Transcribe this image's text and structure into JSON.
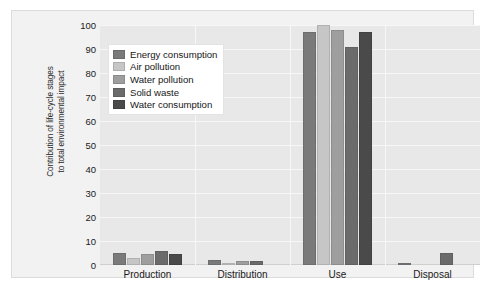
{
  "chart_data": {
    "type": "bar",
    "title": "",
    "xlabel": "",
    "ylabel": "Contribution of life-cycle stages to total environmental impact",
    "ylim": [
      0,
      100
    ],
    "yticks": [
      0,
      10,
      20,
      30,
      40,
      50,
      60,
      70,
      80,
      90,
      100
    ],
    "grid": true,
    "legend_position": "upper left",
    "categories": [
      "Production",
      "Distribution",
      "Use",
      "Disposal"
    ],
    "series": [
      {
        "name": "Energy consumption",
        "color": "#7a7a7a",
        "values": [
          5,
          2,
          97,
          1
        ]
      },
      {
        "name": "Air pollution",
        "color": "#c6c6c6",
        "values": [
          3,
          1,
          100,
          0
        ]
      },
      {
        "name": "Water pollution",
        "color": "#9e9e9e",
        "values": [
          4.5,
          1.5,
          98,
          0
        ]
      },
      {
        "name": "Solid waste",
        "color": "#6b6b6b",
        "values": [
          6,
          1.5,
          91,
          5
        ]
      },
      {
        "name": "Water consumption",
        "color": "#4a4a4a",
        "values": [
          4.5,
          0,
          97,
          0
        ]
      }
    ]
  },
  "ylabel_lines": {
    "line1": "Contribution of life-cycle stages",
    "line2": "to total environmental impact"
  },
  "yticks_text": {
    "t100": "100",
    "t90": "90",
    "t80": "80",
    "t70": "70",
    "t60": "60",
    "t50": "50",
    "t40": "40",
    "t30": "30",
    "t20": "20",
    "t10": "10",
    "t0": "0"
  },
  "xticks_text": {
    "x0": "Production",
    "x1": "Distribution",
    "x2": "Use",
    "x3": "Disposal"
  },
  "legend": {
    "items": [
      {
        "label": "Energy consumption",
        "color": "#7a7a7a"
      },
      {
        "label": "Air pollution",
        "color": "#c6c6c6"
      },
      {
        "label": "Water pollution",
        "color": "#9e9e9e"
      },
      {
        "label": "Solid waste",
        "color": "#6b6b6b"
      },
      {
        "label": "Water consumption",
        "color": "#4a4a4a"
      }
    ]
  },
  "colors": {
    "figure_background": "#f2f2f2",
    "plot_background": "#e8e8e8",
    "gridline": "#f7f7f7",
    "text": "#1a1a1a"
  }
}
